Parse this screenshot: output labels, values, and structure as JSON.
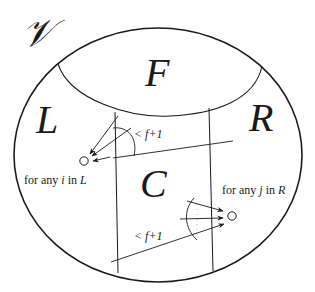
{
  "diagram": {
    "universe_label": "𝒱",
    "regions": {
      "F": "F",
      "L": "L",
      "R": "R",
      "C": "C"
    },
    "annotations": {
      "left_bound": "< f+1",
      "right_bound": "< f+1",
      "left_node_caption_pre": "for any ",
      "left_node_caption_var": "i",
      "left_node_caption_mid": " in ",
      "left_node_caption_set": "L",
      "right_node_caption_pre": "for any ",
      "right_node_caption_var": "j",
      "right_node_caption_mid": " in ",
      "right_node_caption_set": "R"
    },
    "colors": {
      "stroke": "#1a1a1a",
      "background": "#ffffff"
    }
  }
}
